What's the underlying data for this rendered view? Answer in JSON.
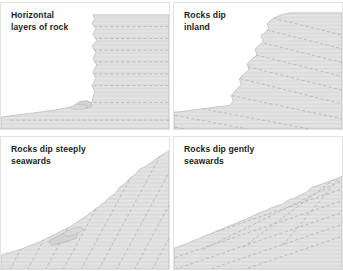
{
  "figure": {
    "name": "coastal-cliff-profiles-rock-dip-diagram",
    "background_color": "#ffffff",
    "panel_border_color": "#e2e2e2",
    "rock_fill_color": "#dcdcdc",
    "rock_outline_color": "#b6b6b6",
    "bedding_line_color": "#a9a9a9",
    "caption_color": "#1d1d1d",
    "panels": [
      {
        "id": "panel-horizontal-layers",
        "caption": "Horizontal\nlayers of rock",
        "dip_description": "horizontal",
        "cliff_profile": "vertical-cliff-right",
        "bedding_angle_deg": 0,
        "bedding_count": 8
      },
      {
        "id": "panel-dip-inland",
        "caption": "Rocks dip\ninland",
        "dip_description": "inland",
        "cliff_profile": "stepped-vertical-cliff-right",
        "bedding_angle_deg": 14,
        "bedding_count": 10
      },
      {
        "id": "panel-dip-steeply-seawards",
        "caption": "Rocks dip steeply\nseawards",
        "dip_description": "steeply seawards",
        "cliff_profile": "steep-slope-rising-right",
        "bedding_angle_deg": -38,
        "bedding_count": 11
      },
      {
        "id": "panel-dip-gently-seawards",
        "caption": "Rocks dip gently\nseawards",
        "dip_description": "gently seawards",
        "cliff_profile": "gentle-slope-rising-right",
        "bedding_angle_deg": -18,
        "bedding_count": 8
      }
    ]
  }
}
